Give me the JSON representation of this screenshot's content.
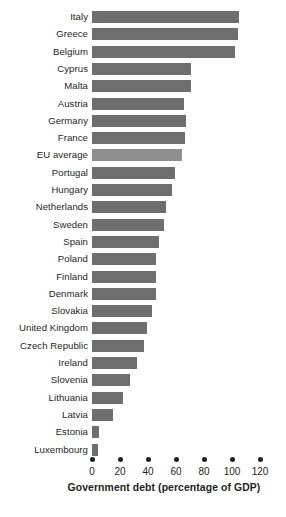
{
  "chart_data": {
    "type": "bar",
    "orientation": "horizontal",
    "title": "",
    "xlabel": "Government debt (percentage of GDP)",
    "ylabel": "",
    "xlim": [
      0,
      125
    ],
    "xticks": [
      0,
      20,
      40,
      60,
      80,
      100,
      120
    ],
    "xtick_labels": [
      "0",
      "20",
      "40",
      "60",
      "80",
      "100",
      "120"
    ],
    "grid": false,
    "legend": "none",
    "bar_color": "#6e6e6e",
    "highlight_color": "#8f8f8f",
    "highlight_category": "EU average",
    "categories": [
      "Italy",
      "Greece",
      "Belgium",
      "Cyprus",
      "Malta",
      "Austria",
      "Germany",
      "France",
      "EU average",
      "Portugal",
      "Hungary",
      "Netherlands",
      "Sweden",
      "Spain",
      "Poland",
      "Finland",
      "Denmark",
      "Slovakia",
      "United Kingdom",
      "Czech Republic",
      "Ireland",
      "Slovenia",
      "Lithuania",
      "Latvia",
      "Estonia",
      "Luxembourg"
    ],
    "values": [
      105,
      104,
      102,
      70.5,
      71,
      66,
      67,
      66.5,
      64,
      59,
      57,
      53,
      51.5,
      47.5,
      45.5,
      45.5,
      45.5,
      42.5,
      39,
      37,
      32,
      27,
      22,
      15,
      5,
      4.5
    ]
  }
}
